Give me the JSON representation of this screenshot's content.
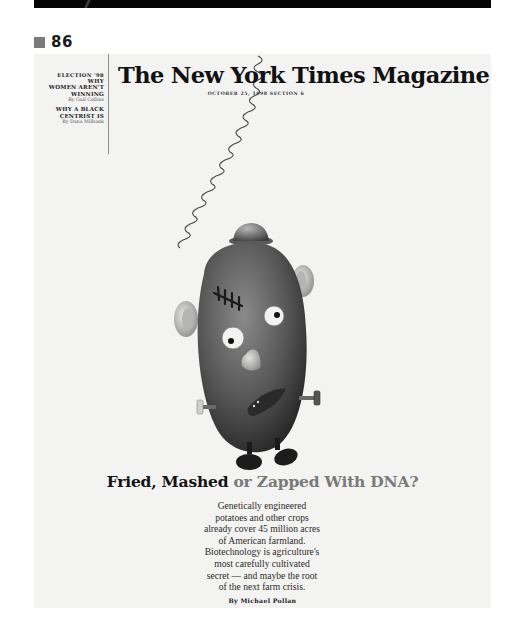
{
  "page": {
    "number": "86"
  },
  "cover": {
    "masthead": "The New York Times Magazine",
    "dateline": "OCTOBER 25, 1998  SECTION 6",
    "sidebar": {
      "kicker": "ELECTION '98",
      "story1": {
        "headline_line1": "WHY",
        "headline_line2": "WOMEN AREN'T",
        "headline_line3": "WINNING",
        "byline": "By Gail Collins"
      },
      "story2": {
        "headline_line1": "WHY A BLACK",
        "headline_line2": "CENTRIST IS",
        "byline": "By Dana Milbank"
      }
    },
    "illustration": {
      "subject": "potato-head figure with Frankenstein bolts hanging from a spring"
    },
    "headline": {
      "part1": "Fried, Mashed ",
      "part2": "or Zapped With DNA?"
    },
    "dek": [
      "Genetically engineered",
      "potatoes and other crops",
      "already cover 45 million acres",
      "of American farmland.",
      "Biotechnology is agriculture's",
      "most carefully cultivated",
      "secret — and maybe the root",
      "of the next farm crisis."
    ],
    "byline": "By Michael Pollan"
  },
  "colors": {
    "cover_bg": "#f3f3f1",
    "headline_dark": "#141414",
    "headline_gray": "#7a7a7a",
    "top_bar": "#050505",
    "page_marker": "#7a7a7a"
  }
}
